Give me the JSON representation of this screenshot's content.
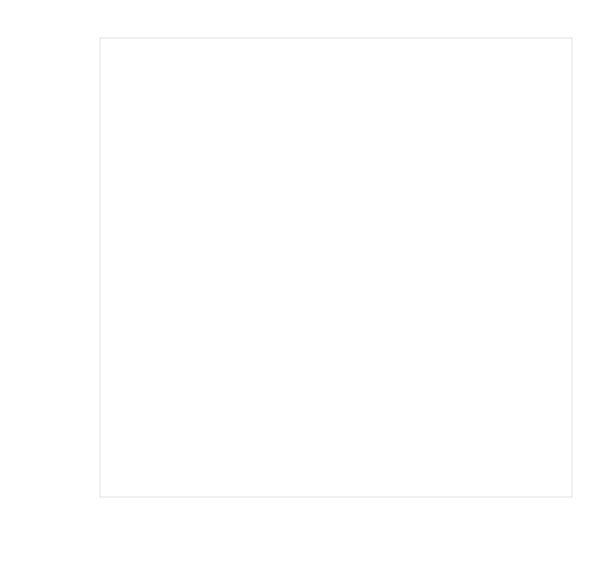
{
  "chart_data": {
    "type": "scatter",
    "title": "",
    "xlabel": "Food Hardship Rate (in 2011)",
    "ylabel": "Obesity Rate (in 2011)",
    "xlim": [
      10,
      25
    ],
    "ylim": [
      20,
      35
    ],
    "xticks": [
      10,
      15,
      20,
      25
    ],
    "yticks": [
      20,
      25,
      30,
      35
    ],
    "xtick_labels": [
      "10%",
      "15%",
      "20%",
      "25%"
    ],
    "ytick_labels": [
      "20%",
      "25%",
      "30%",
      "35%"
    ],
    "grid": false,
    "legend": null,
    "annotations": [
      {
        "name": "mean-of-hardship",
        "text_line1": "Mean of",
        "text_line2": "Hardship",
        "type": "vertical-reference-line",
        "value": 17.9
      },
      {
        "name": "mean-of-obesity",
        "text_line1": "Mean of",
        "text_line2": "Obesity",
        "type": "horizontal-reference-line",
        "value": 27.7
      }
    ],
    "marker": {
      "shape": "open-circle",
      "radius_px": 7,
      "stroke": "#a8a8a8",
      "fill": "none"
    },
    "colors": {
      "marker_stroke": "#a8a8a8",
      "frame": "#eceaea",
      "mean_line": "#e6e4e4",
      "tick_text": "#6b6b6b",
      "axis_title_text": "#5e5e5e",
      "mean_label_text": "#cfcfcf",
      "background": "#ffffff"
    },
    "points": [
      {
        "x": 10.0,
        "y": 27.7
      },
      {
        "x": 12.6,
        "y": 25.8
      },
      {
        "x": 11.8,
        "y": 21.8
      },
      {
        "x": 14.5,
        "y": 24.6
      },
      {
        "x": 15.2,
        "y": 22.7
      },
      {
        "x": 15.5,
        "y": 24.7
      },
      {
        "x": 13.9,
        "y": 27.7
      },
      {
        "x": 14.1,
        "y": 26.3
      },
      {
        "x": 15.0,
        "y": 28.4
      },
      {
        "x": 15.3,
        "y": 29.0
      },
      {
        "x": 15.5,
        "y": 28.5
      },
      {
        "x": 15.1,
        "y": 28.9
      },
      {
        "x": 16.0,
        "y": 26.6
      },
      {
        "x": 16.1,
        "y": 23.8
      },
      {
        "x": 16.5,
        "y": 23.8
      },
      {
        "x": 16.2,
        "y": 20.5
      },
      {
        "x": 16.6,
        "y": 28.6
      },
      {
        "x": 17.0,
        "y": 28.0
      },
      {
        "x": 17.2,
        "y": 27.2
      },
      {
        "x": 17.7,
        "y": 31.3
      },
      {
        "x": 17.8,
        "y": 28.0
      },
      {
        "x": 17.9,
        "y": 27.4
      },
      {
        "x": 17.9,
        "y": 26.8
      },
      {
        "x": 18.0,
        "y": 26.4
      },
      {
        "x": 18.0,
        "y": 25.4
      },
      {
        "x": 17.9,
        "y": 24.4
      },
      {
        "x": 18.1,
        "y": 24.3
      },
      {
        "x": 18.5,
        "y": 27.3
      },
      {
        "x": 19.3,
        "y": 23.8
      },
      {
        "x": 19.9,
        "y": 24.5
      },
      {
        "x": 20.3,
        "y": 24.7
      },
      {
        "x": 19.5,
        "y": 26.9
      },
      {
        "x": 19.8,
        "y": 29.7
      },
      {
        "x": 20.1,
        "y": 30.4
      },
      {
        "x": 20.3,
        "y": 27.8
      },
      {
        "x": 20.6,
        "y": 28.8
      },
      {
        "x": 20.5,
        "y": 28.6
      },
      {
        "x": 20.9,
        "y": 28.8
      },
      {
        "x": 21.0,
        "y": 30.6
      },
      {
        "x": 21.1,
        "y": 30.8
      },
      {
        "x": 21.2,
        "y": 31.1
      },
      {
        "x": 21.5,
        "y": 30.9
      },
      {
        "x": 21.7,
        "y": 30.4
      },
      {
        "x": 22.0,
        "y": 30.2
      },
      {
        "x": 21.3,
        "y": 33.0
      },
      {
        "x": 22.5,
        "y": 32.0
      },
      {
        "x": 23.4,
        "y": 31.6
      },
      {
        "x": 24.5,
        "y": 35.0
      }
    ]
  }
}
